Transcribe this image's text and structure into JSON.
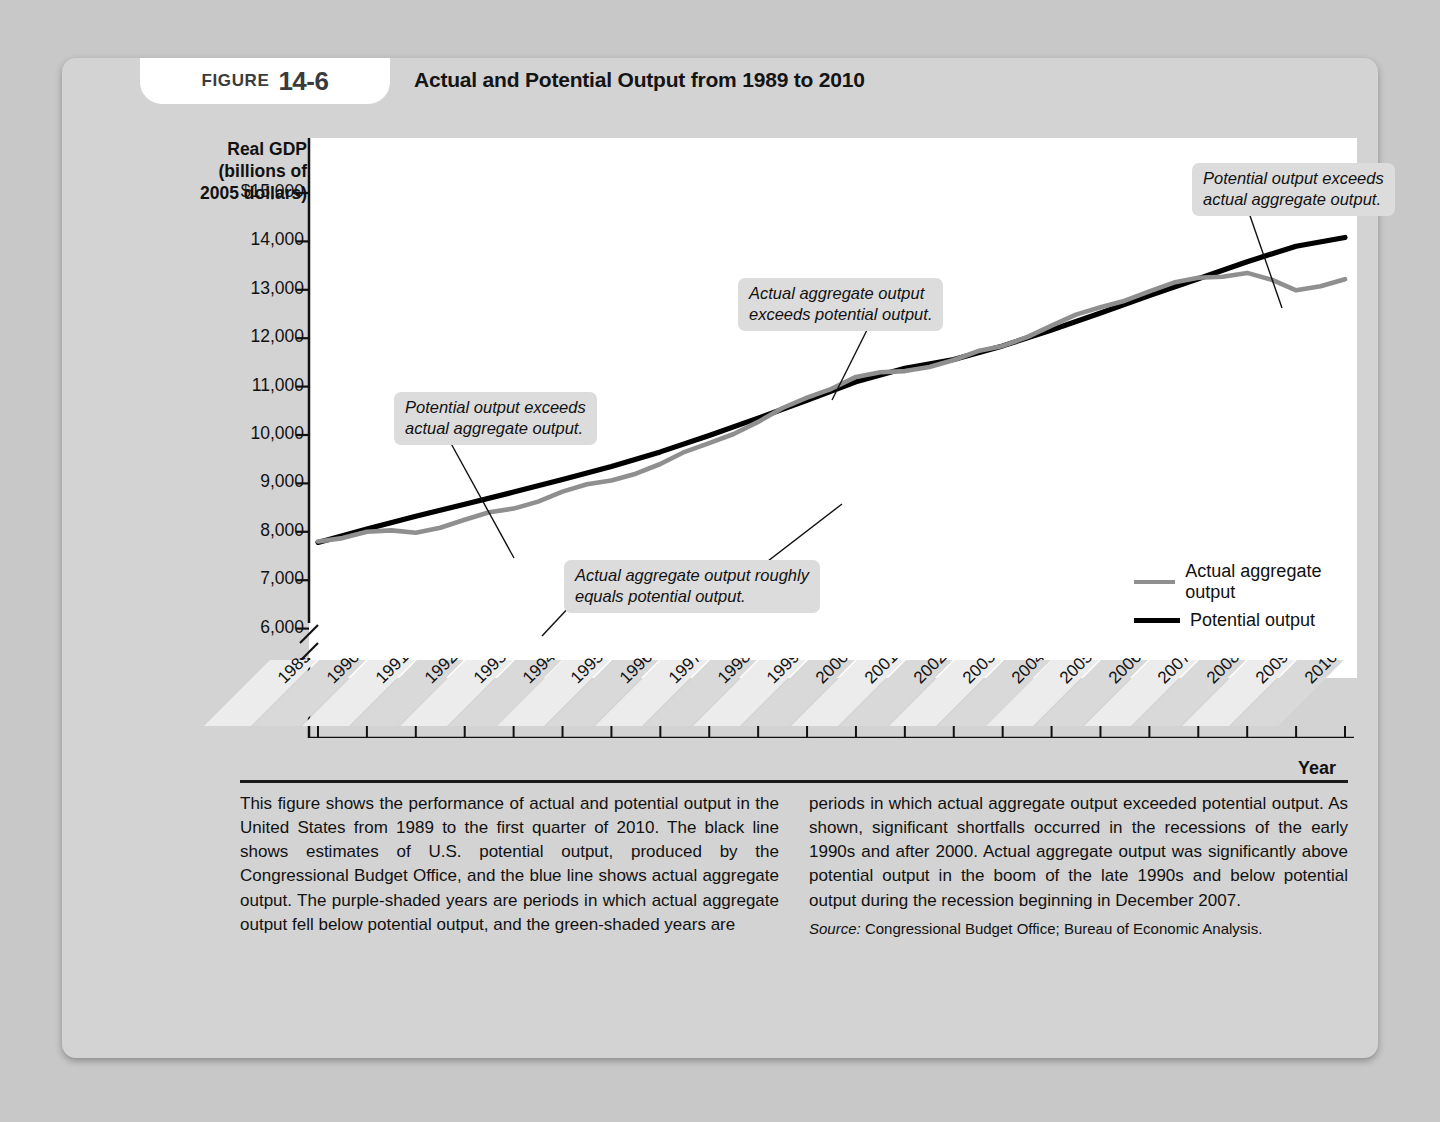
{
  "figure": {
    "badge_word": "FIGURE",
    "badge_number": "14-6",
    "title": "Actual and Potential Output from 1989 to 2010"
  },
  "axes": {
    "y_title": "Real GDP\n(billions of\n2005 dollars)",
    "y_title_lines": [
      "Real GDP",
      "(billions of",
      "2005 dollars)"
    ],
    "y_ticks": [
      "$15,000",
      "14,000",
      "13,000",
      "12,000",
      "11,000",
      "10,000",
      "9,000",
      "8,000",
      "7,000",
      "6,000"
    ],
    "x_title": "Year",
    "x_ticks": [
      "1989",
      "1990",
      "1991",
      "1992",
      "1993",
      "1994",
      "1995",
      "1996",
      "1997",
      "1998",
      "1999",
      "2000",
      "2001",
      "2002",
      "2003",
      "2004",
      "2005",
      "2006",
      "2007",
      "2008",
      "2009",
      "2010"
    ],
    "axis_break": true
  },
  "annotations": [
    {
      "id": "potential-exceeds-actual-early",
      "text_lines": [
        "Potential output exceeds",
        "actual aggregate output."
      ]
    },
    {
      "id": "roughly-equal",
      "text_lines": [
        "Actual aggregate output roughly",
        "equals potential output."
      ]
    },
    {
      "id": "actual-exceeds-potential",
      "text_lines": [
        "Actual aggregate output",
        "exceeds potential output."
      ]
    },
    {
      "id": "potential-exceeds-actual-late",
      "text_lines": [
        "Potential output exceeds",
        "actual aggregate output."
      ]
    }
  ],
  "legend": {
    "position": "inside-bottom-right",
    "items": [
      {
        "label": "Actual aggregate output",
        "color": "#8f8f8f"
      },
      {
        "label": "Potential output",
        "color": "#000000"
      }
    ]
  },
  "caption": {
    "left_column": "This figure shows the performance of actual and potential output in the United States from 1989 to the first quarter of 2010. The black line shows estimates of U.S. potential output, produced by the Congressional Budget Office, and the blue line shows actual aggregate output. The purple-shaded years are periods in which actual aggregate output fell below potential output, and the green-shaded years are",
    "right_column": "periods in which actual aggregate output exceeded potential output. As shown, significant shortfalls occurred in the recessions of the early 1990s and after 2000. Actual aggregate output was significantly above potential output in the boom of the late 1990s and below potential output during the recession beginning in December 2007.",
    "source_label": "Source:",
    "source_text": "Congressional Budget Office; Bureau of Economic Analysis."
  },
  "chart_data": {
    "type": "line",
    "title": "Actual and Potential Output from 1989 to 2010",
    "xlabel": "Year",
    "ylabel": "Real GDP (billions of 2005 dollars)",
    "xlim": [
      1989,
      2010
    ],
    "ylim": [
      6000,
      15000
    ],
    "y_axis_break_below": 6000,
    "grid": false,
    "x": [
      1989,
      1990,
      1991,
      1992,
      1993,
      1994,
      1995,
      1996,
      1997,
      1998,
      1999,
      2000,
      2001,
      2002,
      2003,
      2004,
      2005,
      2006,
      2007,
      2008,
      2009,
      2010
    ],
    "series": [
      {
        "name": "Actual aggregate output",
        "color": "#8f8f8f",
        "values": [
          7800,
          8000,
          7980,
          8250,
          8480,
          8830,
          9060,
          9400,
          9830,
          10270,
          10770,
          11200,
          11320,
          11550,
          11840,
          12260,
          12640,
          12970,
          13250,
          13350,
          12990,
          13220
        ]
      },
      {
        "name": "Potential output",
        "color": "#000000",
        "values": [
          7780,
          8060,
          8320,
          8570,
          8820,
          9080,
          9350,
          9650,
          9990,
          10350,
          10720,
          11100,
          11380,
          11560,
          11840,
          12170,
          12520,
          12880,
          13230,
          13580,
          13900,
          14080
        ]
      }
    ],
    "annotations": [
      {
        "text": "Potential output exceeds actual aggregate output.",
        "points_to_x": 1993
      },
      {
        "text": "Actual aggregate output roughly equals potential output.",
        "points_to_x": 1990
      },
      {
        "text": "Actual aggregate output exceeds potential output.",
        "points_to_x": 1999
      },
      {
        "text": "Potential output exceeds actual aggregate output.",
        "points_to_x": 2008.5
      }
    ]
  }
}
